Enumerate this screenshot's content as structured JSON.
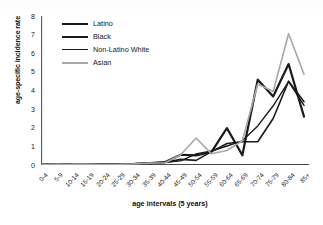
{
  "chart_data": {
    "type": "line",
    "title": "",
    "xlabel": "age intervals (5 years)",
    "ylabel": "age-specific incidence rate",
    "ylim": [
      0,
      8
    ],
    "yticks": [
      0,
      1,
      2,
      3,
      4,
      5,
      6,
      7,
      8
    ],
    "grid": false,
    "legend_position": "upper-left-inside",
    "categories": [
      "0-4",
      "5-9",
      "10-14",
      "15-19",
      "20-24",
      "25-29",
      "30-34",
      "35-39",
      "40-44",
      "45-49",
      "50-54",
      "55-59",
      "60-64",
      "65-69",
      "70-74",
      "75-79",
      "80-84",
      "85+"
    ],
    "series": [
      {
        "name": "Latino",
        "color": "#1a1a1a",
        "width": 1.6,
        "values": [
          0.02,
          0.05,
          0.02,
          0.02,
          0.03,
          0.04,
          0.06,
          0.1,
          0.14,
          0.3,
          0.25,
          0.72,
          1.15,
          1.25,
          1.25,
          2.5,
          4.5,
          3.4
        ]
      },
      {
        "name": "Black",
        "color": "#1a1a1a",
        "width": 2.2,
        "values": [
          0.02,
          0.05,
          0.02,
          0.02,
          0.03,
          0.04,
          0.06,
          0.1,
          0.16,
          0.55,
          0.52,
          0.7,
          1.98,
          0.52,
          4.58,
          3.68,
          5.42,
          2.6
        ]
      },
      {
        "name": "Non-Latino White",
        "color": "#1a1a1a",
        "width": 1.4,
        "values": [
          0.02,
          0.05,
          0.02,
          0.02,
          0.03,
          0.04,
          0.06,
          0.1,
          0.14,
          0.22,
          0.6,
          0.75,
          1.02,
          1.3,
          2.1,
          3.18,
          4.48,
          3.2
        ]
      },
      {
        "name": "Asian",
        "color": "#a8a8a8",
        "width": 1.6,
        "values": [
          0.02,
          0.05,
          0.02,
          0.02,
          0.03,
          0.04,
          0.06,
          0.1,
          0.12,
          0.55,
          1.45,
          0.6,
          0.78,
          1.3,
          4.35,
          3.95,
          7.05,
          4.88
        ]
      }
    ]
  },
  "legend": {
    "items": [
      {
        "label": "Latino"
      },
      {
        "label": "Black"
      },
      {
        "label": "Non-Latino White"
      },
      {
        "label": "Asian"
      }
    ]
  }
}
